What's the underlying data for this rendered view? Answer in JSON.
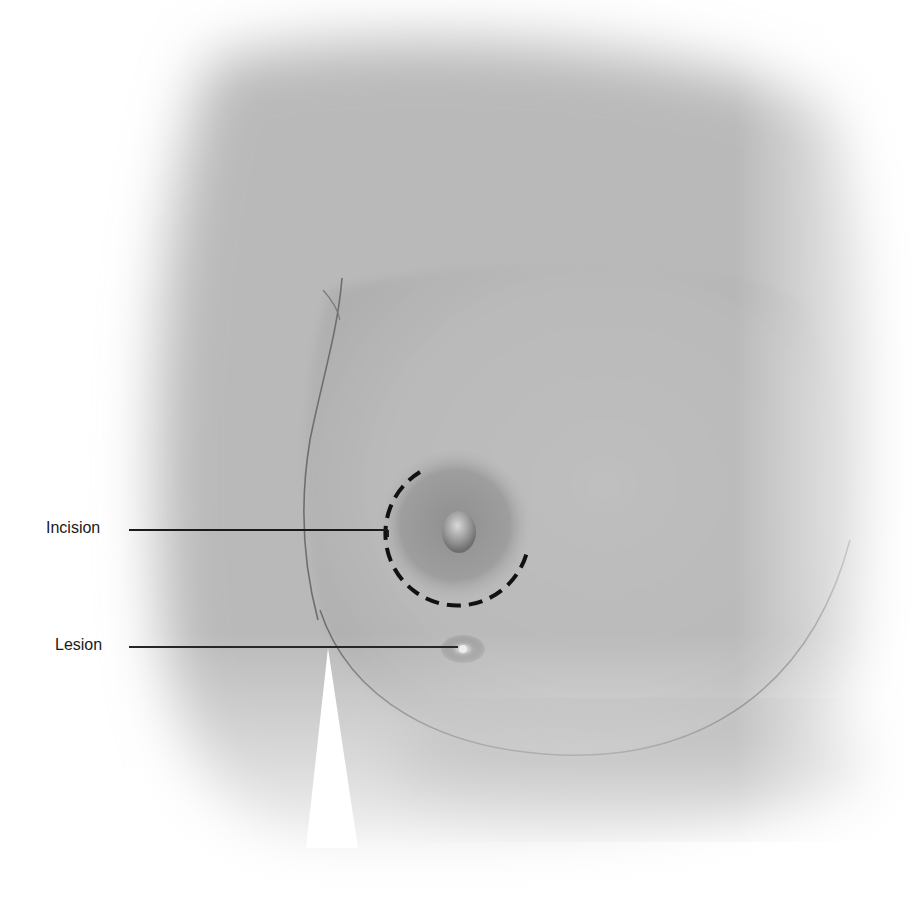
{
  "figure": {
    "type": "medical-illustration",
    "colors": {
      "background": "#ffffff",
      "skin_mid": "#b8b8b8",
      "skin_light": "#d6d6d6",
      "skin_shadow": "#8e8e8e",
      "areola": "#9a9a9a",
      "incision_dash": "#111111",
      "leader_line": "#1a1a1a",
      "contour_line": "#6e6e6e"
    }
  },
  "callouts": [
    {
      "id": "incision",
      "label": "Incision"
    },
    {
      "id": "lesion",
      "label": "Lesion"
    }
  ]
}
